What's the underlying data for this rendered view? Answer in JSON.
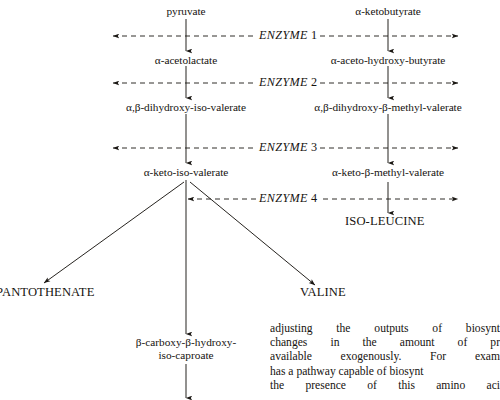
{
  "diagram": {
    "columns": {
      "left_label": "valine branch",
      "right_label": "isoleucine branch"
    },
    "substrates": {
      "left_start": "pyruvate",
      "right_start": "α-ketobutyrate"
    },
    "row1": {
      "left": "α-acetolactate",
      "right": "α-aceto-hydroxy-butyrate"
    },
    "row2": {
      "left": "α,β-dihydroxy-iso-valerate",
      "right": "α,β-dihydroxy-β-methyl-valerate"
    },
    "row3": {
      "left": "α-keto-iso-valerate",
      "right": "α-keto-β-methyl-valerate"
    },
    "enzymes": [
      {
        "name": "ENZYME",
        "number": "1"
      },
      {
        "name": "ENZYME",
        "number": "2"
      },
      {
        "name": "ENZYME",
        "number": "3"
      },
      {
        "name": "ENZYME",
        "number": "4"
      }
    ],
    "products": {
      "isoleucine": "ISO-LEUCINE",
      "pantothenate": "PANTOTHENATE",
      "valine": "VALINE"
    },
    "leucine_branch": {
      "intermediate_line1": "β-carboxy-β-hydroxy-",
      "intermediate_line2": "iso-caproate"
    },
    "line_color": "#1a1713"
  },
  "body_text": {
    "lines": [
      "adjusting the outputs of biosynt",
      "changes in the amount of pr",
      "available exogenously. For exam",
      "has a pathway capable of biosynt",
      "the presence of this amino aci"
    ]
  }
}
